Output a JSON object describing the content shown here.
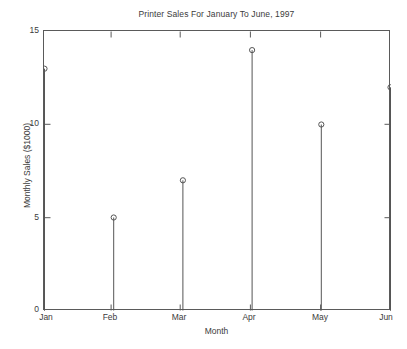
{
  "chart_data": {
    "type": "stem",
    "title": "Printer Sales For January To June, 1997",
    "xlabel": "Month",
    "ylabel": "Monthly Sales ($1000)",
    "categories": [
      "Jan",
      "Feb",
      "Mar",
      "Apr",
      "May",
      "Jun"
    ],
    "values": [
      13,
      5,
      7,
      14,
      10,
      12
    ],
    "series": [
      {
        "name": "Monthly Sales",
        "values": [
          13,
          5,
          7,
          14,
          10,
          12
        ]
      }
    ],
    "ylim": [
      0,
      15
    ],
    "yticks": [
      0,
      5,
      10,
      15
    ],
    "ytick_labels": [
      "0",
      "5",
      "10",
      "15"
    ],
    "xtick_labels": [
      "Jan",
      "Feb",
      "Mar",
      "Apr",
      "May",
      "Jun"
    ],
    "grid": false,
    "legend": false,
    "marker": "open-circle",
    "line_color": "#555555",
    "marker_color": "#555555",
    "background_color": "#ffffff",
    "axis_color": "#5a5a5a"
  },
  "labels": {
    "y_0": "0",
    "y_5": "5",
    "y_10": "10",
    "y_15": "15",
    "x_jan": "Jan",
    "x_feb": "Feb",
    "x_mar": "Mar",
    "x_apr": "Apr",
    "x_may": "May",
    "x_jun": "Jun"
  }
}
